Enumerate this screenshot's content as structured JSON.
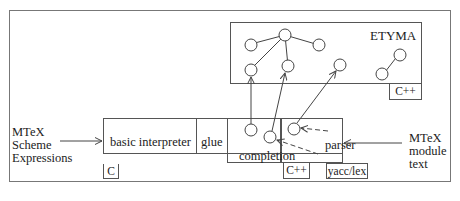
{
  "diagram": {
    "etyma": {
      "title": "ETYMA",
      "lang_tag": "C++"
    },
    "modules": [
      {
        "id": "basic-interpreter",
        "label": "basic interpreter",
        "lang_tag": "C"
      },
      {
        "id": "glue",
        "label": "glue"
      },
      {
        "id": "completion",
        "label": "completion",
        "lang_tag": "C++"
      },
      {
        "id": "parser",
        "label": "parser",
        "lang_tag": "yacc/lex"
      }
    ],
    "inputs": {
      "left": [
        "MTeX",
        "Scheme",
        "Expressions"
      ],
      "right": [
        "MTeX",
        "module",
        "text"
      ]
    },
    "colors": {
      "line": "#555555",
      "text": "#222222",
      "background": "#ffffff"
    }
  }
}
